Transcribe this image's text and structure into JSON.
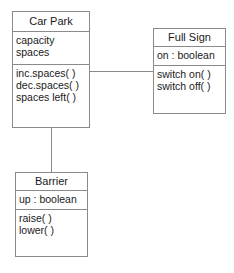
{
  "diagram": {
    "type": "UML class diagram",
    "classes": [
      {
        "name": "Car Park",
        "attributes": [
          "capacity",
          "spaces"
        ],
        "operations": [
          "inc.spaces( )",
          "dec.spaces( )",
          "spaces left( )"
        ]
      },
      {
        "name": "Full Sign",
        "attributes": [
          "on : boolean"
        ],
        "operations": [
          "switch on( )",
          "switch off( )"
        ]
      },
      {
        "name": "Barrier",
        "attributes": [
          "up : boolean"
        ],
        "operations": [
          "raise( )",
          "lower( )"
        ]
      }
    ],
    "associations": [
      {
        "from": "Car Park",
        "to": "Full Sign"
      },
      {
        "from": "Car Park",
        "to": "Barrier"
      }
    ],
    "colors": {
      "line": "#8a8a8a",
      "text": "#1a1a1a",
      "background": "#ffffff"
    }
  }
}
